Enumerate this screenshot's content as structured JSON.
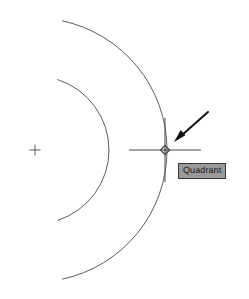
{
  "app": {
    "title": "CAD Drawing Area",
    "background_color": "#ffffff",
    "geometry_color": "#555555",
    "cursor_color": "#4a4a4a",
    "arrow_color": "#111111"
  },
  "drawing": {
    "center_mark": {
      "name": "center-mark",
      "label": "+",
      "x": 35,
      "y": 150,
      "size": 11
    },
    "arcs": [
      {
        "name": "inner-arc",
        "center_x": 35,
        "center_y": 150,
        "radius": 74,
        "start_angle_deg": -72,
        "end_angle_deg": 72,
        "stroke": "#5d5d5d",
        "stroke_width": 1
      },
      {
        "name": "outer-arc",
        "center_x": 35,
        "center_y": 150,
        "radius": 132,
        "start_angle_deg": -78,
        "end_angle_deg": 78,
        "stroke": "#5d5d5d",
        "stroke_width": 1
      }
    ]
  },
  "snap": {
    "point_x": 165,
    "point_y": 150,
    "marker_type": "quadrant",
    "marker_shape": "diamond",
    "marker_size": 9,
    "marker_color": "#4a4a4a",
    "tooltip": {
      "label": "Quadrant",
      "x": 178,
      "y": 163,
      "background": "#9a9a9a",
      "border": "#3a3a3a",
      "text_color": "#1a1a1a"
    }
  },
  "cursor": {
    "name": "crosshair-cursor",
    "center_x": 165,
    "center_y": 150,
    "horizontal_half_length": 36,
    "vertical_half_length": 32,
    "color": "#4a4a4a"
  },
  "annotation": {
    "arrow": {
      "name": "pointer-arrow",
      "tail_x": 208,
      "tail_y": 112,
      "tip_x": 174,
      "tip_y": 142,
      "color": "#111111",
      "width": 2
    }
  }
}
